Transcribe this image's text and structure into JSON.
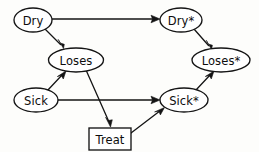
{
  "diagram": {
    "background_color": "#fdfdfb",
    "line_color": "#141414",
    "node_fill": "#ffffff",
    "nodes": [
      {
        "id": "dry",
        "label": "Dry",
        "shape": "ellipse",
        "cx": 33,
        "cy": 20,
        "rx": 19,
        "ry": 12
      },
      {
        "id": "loses",
        "label": "Loses",
        "shape": "ellipse",
        "cx": 76,
        "cy": 60,
        "rx": 27.5,
        "ry": 12
      },
      {
        "id": "sick",
        "label": "Sick",
        "shape": "ellipse",
        "cx": 36,
        "cy": 100,
        "rx": 22,
        "ry": 12
      },
      {
        "id": "treat",
        "label": "Treat",
        "shape": "rectangle",
        "x": 89,
        "y": 128,
        "w": 42,
        "h": 22
      },
      {
        "id": "dry2",
        "label": "Dry*",
        "shape": "ellipse",
        "cx": 181,
        "cy": 20,
        "rx": 21,
        "ry": 12
      },
      {
        "id": "loses2",
        "label": "Loses*",
        "shape": "ellipse",
        "cx": 221,
        "cy": 60,
        "rx": 29,
        "ry": 12
      },
      {
        "id": "sick2",
        "label": "Sick*",
        "shape": "ellipse",
        "cx": 184,
        "cy": 100,
        "rx": 24,
        "ry": 12
      }
    ],
    "edges": [
      {
        "id": "dry-to-dry2",
        "from": "Dry",
        "to": "Dry*",
        "x1": 52,
        "y1": 19,
        "x2": 159,
        "y2": 19
      },
      {
        "id": "dry-to-loses",
        "from": "Dry",
        "to": "Loses",
        "x1": 45,
        "y1": 29,
        "x2": 62,
        "y2": 47
      },
      {
        "id": "sick-to-loses",
        "from": "Sick",
        "to": "Loses",
        "x1": 47,
        "y1": 91,
        "x2": 65,
        "y2": 72
      },
      {
        "id": "sick-to-sick2",
        "from": "Sick",
        "to": "Sick*",
        "x1": 58,
        "y1": 100,
        "x2": 159,
        "y2": 100
      },
      {
        "id": "loses-to-treat",
        "from": "Loses",
        "to": "Treat",
        "x1": 86,
        "y1": 70,
        "x2": 110,
        "y2": 126
      },
      {
        "id": "treat-to-sick2",
        "from": "Treat",
        "to": "Sick*",
        "x1": 131,
        "y1": 133,
        "x2": 164,
        "y2": 108
      },
      {
        "id": "dry2-to-loses2",
        "from": "Dry*",
        "to": "Loses*",
        "x1": 194,
        "y1": 29,
        "x2": 211,
        "y2": 48
      },
      {
        "id": "sick2-to-loses2",
        "from": "Sick*",
        "to": "Loses*",
        "x1": 196,
        "y1": 90,
        "x2": 213,
        "y2": 72
      }
    ]
  }
}
